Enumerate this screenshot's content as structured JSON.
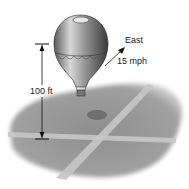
{
  "diagram": {
    "height_label": "100 ft",
    "direction_label": "East",
    "speed_label": "15 mph",
    "colors": {
      "ground": "#9a9a9a",
      "road": "#c4c4c4",
      "balloon_dark": "#6e6e6e",
      "balloon_light": "#e0e0e0",
      "shadow": "#7a7a7a",
      "line": "#111111"
    }
  }
}
